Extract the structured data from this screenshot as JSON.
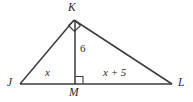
{
  "figure": {
    "kind": "geometry-diagram",
    "shape": "right-triangle-with-altitude",
    "background_color": "#ffffff",
    "stroke_color": "#3b3b3b",
    "text_color": "#2b2b2b",
    "width": 193,
    "height": 102
  },
  "vertices": [
    {
      "id": "K",
      "label": "K",
      "x": 74,
      "y": 20,
      "label_x": 73,
      "label_y": 2,
      "name": "vertex-label-k"
    },
    {
      "id": "J",
      "label": "J",
      "x": 20,
      "y": 84,
      "label_x": 8,
      "label_y": 77,
      "name": "vertex-label-j"
    },
    {
      "id": "M",
      "label": "M",
      "x": 75,
      "y": 84,
      "label_x": 69,
      "label_y": 87,
      "name": "vertex-label-m"
    },
    {
      "id": "L",
      "label": "L",
      "x": 172,
      "y": 84,
      "label_x": 178,
      "label_y": 77,
      "name": "vertex-label-l"
    }
  ],
  "segments": [
    {
      "id": "JK",
      "from": "J",
      "to": "K",
      "name": "segment-jk"
    },
    {
      "id": "KL",
      "from": "K",
      "to": "L",
      "name": "segment-kl"
    },
    {
      "id": "JL",
      "from": "J",
      "to": "L",
      "name": "segment-jl"
    },
    {
      "id": "KM",
      "from": "K",
      "to": "M",
      "name": "segment-km-altitude"
    }
  ],
  "measures": {
    "altitude": {
      "text": "6",
      "label_x": 79,
      "label_y": 44,
      "segment": "KM",
      "upright": true
    },
    "left_leg": {
      "text": "x",
      "label_x": 45,
      "label_y": 67,
      "segment": "JM",
      "upright": false
    },
    "right_leg": {
      "text": "x + 5",
      "label_x": 105,
      "label_y": 67,
      "segment": "ML",
      "upright": false
    }
  },
  "right_angles": [
    {
      "id": "angle-K",
      "at": "K",
      "style": "diamond",
      "size": 9,
      "name": "right-angle-mark-k"
    },
    {
      "id": "angle-M",
      "at": "M",
      "style": "square",
      "size": 7,
      "name": "right-angle-mark-m"
    }
  ]
}
